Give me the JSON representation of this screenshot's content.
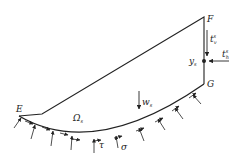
{
  "diagram": {
    "type": "slope-stability sliding block free-body diagram",
    "labels": {
      "E": "E",
      "F": "F",
      "G": "G",
      "region": "Ω",
      "region_sub": "s",
      "point": "y",
      "point_sub": "s",
      "vertical_traction": "t",
      "vertical_traction_sub": "v",
      "vertical_traction_sup": "s",
      "horizontal_traction": "t",
      "horizontal_traction_sub": "h",
      "horizontal_traction_sup": "s",
      "weight": "w",
      "weight_sub": "s",
      "shear_stress": "τ",
      "normal_stress": "σ"
    },
    "colors": {
      "line": "#222222",
      "background": "#ffffff"
    }
  }
}
